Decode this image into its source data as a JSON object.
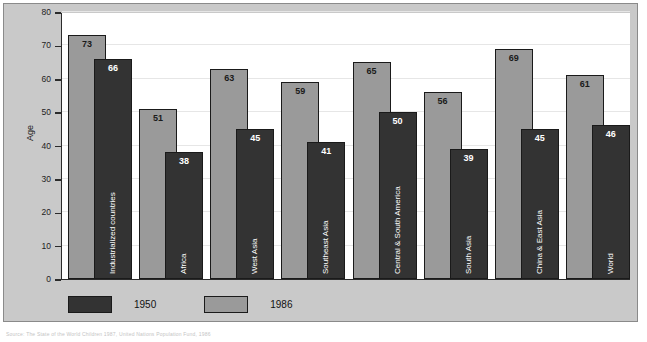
{
  "chart_data": {
    "type": "bar",
    "title": "",
    "subtitle": "",
    "xlabel": "",
    "ylabel": "Age",
    "ylim": [
      0,
      80
    ],
    "yticks": [
      0,
      10,
      20,
      30,
      40,
      50,
      60,
      70,
      80
    ],
    "grid": true,
    "legend_position": "bottom-left",
    "categories": [
      "Industrialized countries",
      "Africa",
      "West Asia",
      "Southeast Asia",
      "Central & South America",
      "South Asia",
      "China & East Asia",
      "World"
    ],
    "series": [
      {
        "name": "1986",
        "color": "#9a9a9a",
        "values": [
          73,
          51,
          63,
          59,
          65,
          56,
          69,
          61
        ]
      },
      {
        "name": "1950",
        "color": "#333333",
        "values": [
          66,
          38,
          45,
          41,
          50,
          39,
          45,
          46
        ]
      }
    ]
  },
  "axis": {
    "y_title": "Age",
    "y_tick_labels": [
      "80",
      "70",
      "60",
      "50",
      "40",
      "30",
      "20",
      "10",
      "0"
    ]
  },
  "legend": {
    "items": [
      {
        "label": "1950",
        "swatch": "dark"
      },
      {
        "label": "1986",
        "swatch": "light"
      }
    ]
  },
  "caption": {
    "source": "Source: The State of the World Children 1987, United Nations Population Fund, 1986"
  }
}
